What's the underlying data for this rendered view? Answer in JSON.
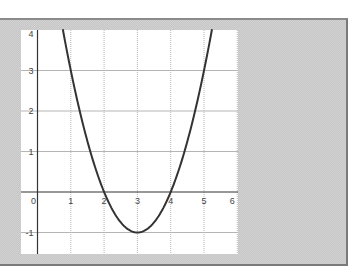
{
  "chart_data": {
    "type": "line",
    "title": "",
    "xlabel": "",
    "ylabel": "",
    "function": "y = x^2 - 6x + 8",
    "xlim": [
      -0.5,
      6.05
    ],
    "ylim": [
      -1.55,
      4.0
    ],
    "grid": true,
    "legend": null,
    "x_ticks": [
      "0",
      "1",
      "2",
      "3",
      "4",
      "5",
      "6"
    ],
    "y_ticks": [
      "4",
      "3",
      "2",
      "1",
      "-1"
    ],
    "series": [
      {
        "name": "parabola",
        "color": "#333333",
        "x": [
          0.76,
          1,
          1.5,
          2,
          2.5,
          3,
          3.5,
          4,
          4.5,
          5,
          5.24
        ],
        "y": [
          4.0,
          3,
          1.25,
          0,
          -0.75,
          -1,
          -0.75,
          0,
          1.25,
          3,
          4.0
        ]
      }
    ],
    "key_points": {
      "roots": [
        2,
        4
      ],
      "vertex": [
        3,
        -1
      ]
    }
  },
  "colors": {
    "frame_background": "#d2d2d2",
    "plot_background": "#ffffff",
    "axis": "#333333",
    "grid": "#b5b5b5",
    "curve": "#333333"
  }
}
